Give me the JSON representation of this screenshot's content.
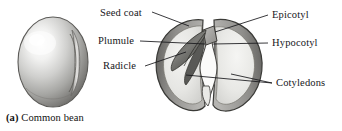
{
  "figure": {
    "caption_tag": "(a)",
    "caption_text": "Common bean",
    "background_color": "#ffffff",
    "ink_color": "#16161a"
  },
  "labels": [
    {
      "id": "seed-coat",
      "text": "Seed coat",
      "x": 100,
      "y": 8,
      "side": "left"
    },
    {
      "id": "plumule",
      "text": "Plumule",
      "x": 98,
      "y": 38,
      "side": "left"
    },
    {
      "id": "radicle",
      "text": "Radicle",
      "x": 103,
      "y": 63,
      "side": "left"
    },
    {
      "id": "epicotyl",
      "text": "Epicotyl",
      "x": 272,
      "y": 12,
      "side": "right"
    },
    {
      "id": "hypocotyl",
      "text": "Hypocotyl",
      "x": 272,
      "y": 40,
      "side": "right"
    },
    {
      "id": "cotyledons",
      "text": "Cotyledons",
      "x": 276,
      "y": 80,
      "side": "right"
    }
  ],
  "structures": [
    {
      "id": "whole-seed",
      "name": "whole common bean seed"
    },
    {
      "id": "split-seed",
      "name": "split bean showing embryo"
    },
    {
      "id": "cotyledon-left",
      "name": "left cotyledon"
    },
    {
      "id": "cotyledon-right",
      "name": "right cotyledon"
    },
    {
      "id": "embryo",
      "name": "embryo with plumule and radicle"
    }
  ]
}
